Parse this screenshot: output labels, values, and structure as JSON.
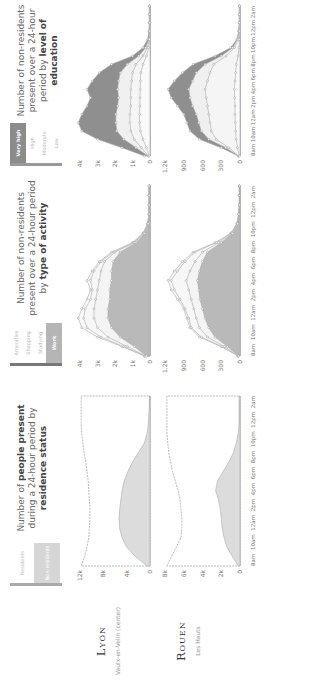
{
  "rows": [
    {
      "city": "Lyon",
      "district": "Vaulx-en-Velin (center)"
    },
    {
      "city": "Rouen",
      "district": "Les Hauts"
    }
  ],
  "panels": [
    {
      "title_pre": "Number of ",
      "title_bold": "people present",
      "title_mid": " during a 24-hour period by ",
      "title_bold2": "residence status",
      "legend": [
        "Residents",
        "Non-residents"
      ],
      "legend_colors": [
        "#e6e6e6",
        "#cfcfcf"
      ]
    },
    {
      "title_pre": "Number of non-residents present over a 24-hour period by ",
      "title_bold": "type of activity",
      "legend": [
        "Amenities",
        "Shopping",
        "Studying",
        "Work"
      ],
      "legend_colors": [
        "#f0f0f0",
        "#f0f0f0",
        "#f0f0f0",
        "#b5b5b5"
      ]
    },
    {
      "title_pre": "Number of non-residents present over a 24-hour period by ",
      "title_bold": "level of education",
      "legend": [
        "Very high",
        "High",
        "Moderate",
        "Low"
      ],
      "legend_colors": [
        "#8c8c8c",
        "#f0f0f0",
        "#f0f0f0",
        "#f0f0f0"
      ]
    }
  ],
  "x_ticks": [
    "8am",
    "10am",
    "12am",
    "2pm",
    "4pm",
    "6pm",
    "8pm",
    "10pm",
    "12pm",
    "2am"
  ],
  "chart_data": [
    {
      "type": "area",
      "title": "Number of people present during a 24-hour period by residence status — Lyon (Vaulx-en-Velin center)",
      "x": [
        "8am",
        "9am",
        "10am",
        "11am",
        "12am",
        "1pm",
        "2pm",
        "3pm",
        "4pm",
        "5pm",
        "6pm",
        "7pm",
        "8pm",
        "9pm",
        "10pm",
        "11pm",
        "12pm",
        "1am",
        "2am"
      ],
      "ylim": [
        0,
        12000
      ],
      "y_ticks": [
        "0",
        "4k",
        "8k",
        "12k"
      ],
      "series": [
        {
          "name": "Non-residents",
          "values": [
            500,
            2500,
            4000,
            4800,
            5200,
            5300,
            5200,
            5000,
            4800,
            4400,
            3800,
            3000,
            2000,
            1000,
            500,
            300,
            200,
            100,
            100
          ]
        },
        {
          "name": "Residents (total line)",
          "values": [
            11800,
            11200,
            10800,
            10500,
            10400,
            10300,
            10300,
            10400,
            10500,
            10600,
            10800,
            11000,
            11300,
            11500,
            11700,
            11800,
            11800,
            11800,
            11800
          ]
        }
      ]
    },
    {
      "type": "area",
      "title": "Number of people present during a 24-hour period by residence status — Rouen (Les Hauts)",
      "x": [
        "8am",
        "9am",
        "10am",
        "11am",
        "12am",
        "1pm",
        "2pm",
        "3pm",
        "4pm",
        "5pm",
        "6pm",
        "7pm",
        "8pm",
        "9pm",
        "10pm",
        "11pm",
        "12pm",
        "1am",
        "2am"
      ],
      "ylim": [
        0,
        8000
      ],
      "y_ticks": [
        "0",
        "2k",
        "4k",
        "6k",
        "8k"
      ],
      "series": [
        {
          "name": "Non-residents",
          "values": [
            200,
            800,
            1400,
            1700,
            1900,
            2000,
            2100,
            2300,
            2600,
            2400,
            1800,
            1200,
            700,
            400,
            200,
            100,
            100,
            100,
            100
          ]
        },
        {
          "name": "Residents (total line)",
          "values": [
            7800,
            7300,
            6800,
            6300,
            6200,
            6200,
            6300,
            6400,
            6600,
            6900,
            7200,
            7400,
            7600,
            7700,
            7800,
            7800,
            7800,
            7800,
            7800
          ]
        }
      ]
    },
    {
      "type": "area",
      "title": "Number of non-residents present over a 24-hour period by type of activity — Lyon",
      "x": [
        "8am",
        "9am",
        "10am",
        "11am",
        "12am",
        "1pm",
        "2pm",
        "3pm",
        "4pm",
        "5pm",
        "6pm",
        "7pm",
        "8pm",
        "9pm",
        "10pm",
        "11pm",
        "12pm",
        "1am",
        "2am"
      ],
      "ylim": [
        0,
        4000
      ],
      "y_ticks": [
        "0",
        "1k",
        "2k",
        "3k",
        "4k"
      ],
      "series": [
        {
          "name": "Work",
          "values": [
            200,
            900,
            1700,
            2200,
            2400,
            2400,
            2300,
            2300,
            2200,
            2200,
            2100,
            1700,
            800,
            300,
            100,
            50,
            50,
            50,
            50
          ]
        },
        {
          "name": "Studying",
          "values": [
            250,
            1300,
            2400,
            3000,
            3200,
            3200,
            3100,
            3000,
            2900,
            2800,
            2600,
            2000,
            900,
            350,
            120,
            60,
            50,
            50,
            50
          ]
        },
        {
          "name": "Shopping",
          "values": [
            300,
            1500,
            2800,
            3600,
            3800,
            3700,
            3400,
            3300,
            3400,
            3200,
            2800,
            2100,
            950,
            380,
            130,
            60,
            50,
            50,
            50
          ]
        },
        {
          "name": "Amenities",
          "values": [
            320,
            1600,
            3000,
            3900,
            4100,
            3900,
            3600,
            3400,
            3600,
            3300,
            2900,
            2200,
            1000,
            400,
            140,
            60,
            50,
            50,
            50
          ]
        }
      ]
    },
    {
      "type": "area",
      "title": "Number of non-residents present over a 24-hour period by type of activity — Rouen",
      "x": [
        "8am",
        "9am",
        "10am",
        "11am",
        "12am",
        "1pm",
        "2pm",
        "3pm",
        "4pm",
        "5pm",
        "6pm",
        "7pm",
        "8pm",
        "9pm",
        "10pm",
        "11pm",
        "12pm",
        "1am",
        "2am"
      ],
      "ylim": [
        0,
        1200
      ],
      "y_ticks": [
        "0",
        "300",
        "600",
        "900",
        "1.2k"
      ],
      "series": [
        {
          "name": "Work",
          "values": [
            20,
            200,
            400,
            500,
            560,
            600,
            640,
            660,
            680,
            650,
            600,
            520,
            300,
            120,
            40,
            20,
            10,
            10,
            10
          ]
        },
        {
          "name": "Studying",
          "values": [
            25,
            250,
            520,
            650,
            700,
            740,
            780,
            820,
            860,
            800,
            720,
            600,
            340,
            130,
            45,
            20,
            10,
            10,
            10
          ]
        },
        {
          "name": "Shopping",
          "values": [
            30,
            290,
            620,
            780,
            820,
            880,
            960,
            1050,
            1100,
            1000,
            880,
            720,
            380,
            140,
            50,
            20,
            10,
            10,
            10
          ]
        },
        {
          "name": "Amenities",
          "values": [
            30,
            300,
            650,
            800,
            850,
            900,
            1000,
            1100,
            1150,
            1050,
            920,
            750,
            400,
            150,
            50,
            20,
            10,
            10,
            10
          ]
        }
      ]
    },
    {
      "type": "area",
      "title": "Number of non-residents present over a 24-hour period by level of education — Lyon",
      "x": [
        "8am",
        "9am",
        "10am",
        "11am",
        "12am",
        "1pm",
        "2pm",
        "3pm",
        "4pm",
        "5pm",
        "6pm",
        "7pm",
        "8pm",
        "9pm",
        "10pm",
        "11pm",
        "12pm",
        "1am",
        "2am"
      ],
      "ylim": [
        0,
        4000
      ],
      "y_ticks": [
        "0",
        "1k",
        "2k",
        "3k",
        "4k"
      ],
      "series": [
        {
          "name": "Low",
          "values": [
            50,
            200,
            400,
            550,
            600,
            600,
            580,
            570,
            560,
            550,
            520,
            400,
            200,
            80,
            30,
            20,
            20,
            20,
            20
          ]
        },
        {
          "name": "Moderate",
          "values": [
            80,
            500,
            900,
            1100,
            1150,
            1150,
            1100,
            1100,
            1100,
            1050,
            1000,
            800,
            400,
            150,
            50,
            30,
            20,
            20,
            20
          ]
        },
        {
          "name": "High",
          "values": [
            120,
            800,
            1500,
            1900,
            1950,
            1950,
            1850,
            1800,
            1850,
            1800,
            1700,
            1300,
            650,
            250,
            80,
            40,
            20,
            20,
            20
          ]
        },
        {
          "name": "Very high",
          "values": [
            320,
            1600,
            3000,
            3900,
            4100,
            3900,
            3600,
            3400,
            3600,
            3300,
            2900,
            2200,
            1000,
            400,
            140,
            60,
            50,
            50,
            50
          ]
        }
      ]
    },
    {
      "type": "area",
      "title": "Number of non-residents present over a 24-hour period by level of education — Rouen",
      "x": [
        "8am",
        "9am",
        "10am",
        "11am",
        "12am",
        "1pm",
        "2pm",
        "3pm",
        "4pm",
        "5pm",
        "6pm",
        "7pm",
        "8pm",
        "9pm",
        "10pm",
        "11pm",
        "12pm",
        "1am",
        "2am"
      ],
      "ylim": [
        0,
        1200
      ],
      "y_ticks": [
        "0",
        "300",
        "600",
        "900",
        "1.2k"
      ],
      "series": [
        {
          "name": "Low",
          "values": [
            10,
            40,
            60,
            70,
            75,
            80,
            80,
            85,
            90,
            80,
            70,
            60,
            30,
            15,
            10,
            10,
            10,
            10,
            10
          ]
        },
        {
          "name": "Moderate",
          "values": [
            20,
            180,
            380,
            460,
            480,
            500,
            520,
            540,
            560,
            520,
            480,
            420,
            220,
            90,
            30,
            15,
            10,
            10,
            10
          ]
        },
        {
          "name": "High",
          "values": [
            25,
            230,
            500,
            620,
            660,
            700,
            760,
            800,
            820,
            760,
            700,
            560,
            300,
            120,
            40,
            20,
            10,
            10,
            10
          ]
        },
        {
          "name": "Very high",
          "values": [
            30,
            300,
            650,
            800,
            850,
            900,
            1000,
            1100,
            1150,
            1050,
            920,
            750,
            400,
            150,
            50,
            20,
            10,
            10,
            10
          ]
        }
      ]
    }
  ]
}
